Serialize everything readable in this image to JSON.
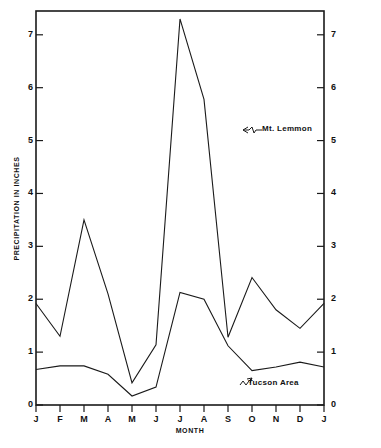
{
  "figure": {
    "background_color": "#ffffff",
    "ink_color": "#1a1a1a"
  },
  "chart_data": {
    "type": "line",
    "title": "",
    "xlabel": "MONTH",
    "ylabel": "PRECIPITATION IN INCHES",
    "categories": [
      "J",
      "F",
      "M",
      "A",
      "M",
      "J",
      "J",
      "A",
      "S",
      "O",
      "N",
      "D",
      "J"
    ],
    "x_tick_labels": [
      "J",
      "F",
      "M",
      "A",
      "M",
      "J",
      "J",
      "A",
      "S",
      "O",
      "N",
      "D",
      "J"
    ],
    "y_tick_labels": [
      "0",
      "1",
      "2",
      "3",
      "4",
      "5",
      "6",
      "7"
    ],
    "y_tick_labels_right": [
      "0",
      "1",
      "2",
      "3",
      "4",
      "5",
      "6",
      "7"
    ],
    "ylim": [
      0,
      7.45
    ],
    "yticks": [
      0,
      1,
      2,
      3,
      4,
      5,
      6,
      7
    ],
    "grid": false,
    "legend": "none",
    "axis_ticks_both_sides": true,
    "series": [
      {
        "name": "Mt. Lemmon",
        "values": [
          1.92,
          1.3,
          3.5,
          2.1,
          0.42,
          1.14,
          7.3,
          5.78,
          1.28,
          2.41,
          1.8,
          1.45,
          1.92
        ]
      },
      {
        "name": "Tucson Area",
        "values": [
          0.67,
          0.74,
          0.74,
          0.58,
          0.17,
          0.34,
          2.13,
          2.0,
          1.12,
          0.65,
          0.72,
          0.81,
          0.72
        ]
      }
    ],
    "annotations": [
      {
        "text": "Mt. Lemmon",
        "target_series": "Mt. Lemmon"
      },
      {
        "text": "Tucson Area",
        "target_series": "Tucson Area"
      }
    ]
  }
}
